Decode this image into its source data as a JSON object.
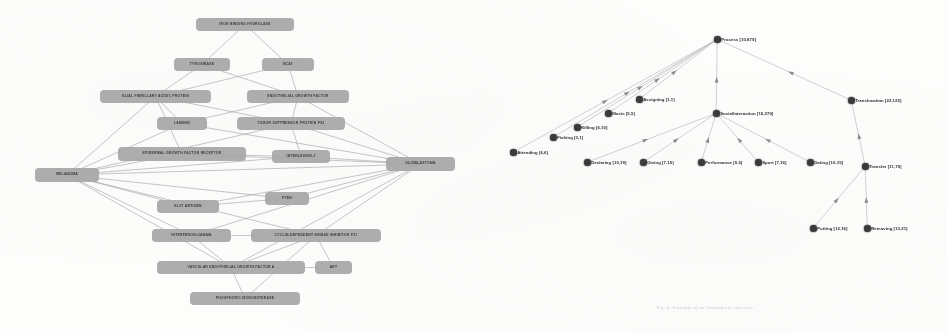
{
  "page": {
    "background_color": "#fdfdfc",
    "caption": "Fig. 4. Example of an Ontological structure"
  },
  "left_figure": {
    "name": "melanoma-glioblastoma-association-graph",
    "type": "node-link-graph",
    "node_fill_color": "#a8a8a8",
    "node_text_color": "#2e2e2e",
    "edge_color": "#9a9a9a",
    "hub_left": "MELANOMA",
    "hub_right": "GLIOBLASTOMA",
    "nodes": [
      {
        "id": "n0",
        "label": "IRON BINDING HYDROLASE",
        "x": 196,
        "y": 18,
        "w": 98,
        "h": 13
      },
      {
        "id": "n1",
        "label": "TYROSINASE",
        "x": 174,
        "y": 58,
        "w": 56,
        "h": 13
      },
      {
        "id": "n2",
        "label": "NCAT",
        "x": 262,
        "y": 58,
        "w": 52,
        "h": 13
      },
      {
        "id": "n3",
        "label": "GLIAL FIBRILLARY ACIDIC PROTEIN",
        "x": 100,
        "y": 90,
        "w": 111,
        "h": 13
      },
      {
        "id": "n4",
        "label": "ENDOTHELIAL GROWTH FACTOR",
        "x": 247,
        "y": 90,
        "w": 102,
        "h": 13
      },
      {
        "id": "n5",
        "label": "LAMININ",
        "x": 157,
        "y": 117,
        "w": 50,
        "h": 13
      },
      {
        "id": "n6",
        "label": "TUMOR SUPPRESSOR PROTEIN P53",
        "x": 237,
        "y": 117,
        "w": 108,
        "h": 13
      },
      {
        "id": "n7",
        "label": "EPIDERMAL GROWTH FACTOR RECEPTOR",
        "x": 118,
        "y": 147,
        "w": 128,
        "h": 14
      },
      {
        "id": "n8",
        "label": "INTERLEUKIN-2",
        "x": 272,
        "y": 150,
        "w": 58,
        "h": 13
      },
      {
        "id": "n9",
        "label": "MELANOMA",
        "x": 35,
        "y": 168,
        "w": 64,
        "h": 14
      },
      {
        "id": "n10",
        "label": "GLIOBLASTOMA",
        "x": 386,
        "y": 157,
        "w": 69,
        "h": 14
      },
      {
        "id": "n11",
        "label": "KI-67 ANTIGEN",
        "x": 157,
        "y": 200,
        "w": 62,
        "h": 13
      },
      {
        "id": "n12",
        "label": "PTEN",
        "x": 265,
        "y": 192,
        "w": 44,
        "h": 13
      },
      {
        "id": "n13",
        "label": "INTERFERON-GAMMA",
        "x": 152,
        "y": 229,
        "w": 79,
        "h": 13
      },
      {
        "id": "n14",
        "label": "CYCLIN-DEPENDENT KINASE INHIBITOR P21",
        "x": 251,
        "y": 229,
        "w": 130,
        "h": 13
      },
      {
        "id": "n15",
        "label": "VASCULAR ENDOTHELIAL GROWTH FACTOR A",
        "x": 157,
        "y": 261,
        "w": 148,
        "h": 13
      },
      {
        "id": "n16",
        "label": "AKT",
        "x": 315,
        "y": 261,
        "w": 37,
        "h": 13
      },
      {
        "id": "n17",
        "label": "PHOSPHORIC MONOESTERASE",
        "x": 190,
        "y": 292,
        "w": 110,
        "h": 13
      }
    ],
    "edges": [
      [
        "n0",
        "n1"
      ],
      [
        "n0",
        "n2"
      ],
      [
        "n1",
        "n3"
      ],
      [
        "n1",
        "n4"
      ],
      [
        "n2",
        "n3"
      ],
      [
        "n2",
        "n4"
      ],
      [
        "n3",
        "n5"
      ],
      [
        "n3",
        "n6"
      ],
      [
        "n4",
        "n5"
      ],
      [
        "n4",
        "n6"
      ],
      [
        "n3",
        "n9"
      ],
      [
        "n3",
        "n7"
      ],
      [
        "n4",
        "n10"
      ],
      [
        "n6",
        "n10"
      ],
      [
        "n6",
        "n8"
      ],
      [
        "n9",
        "n5"
      ],
      [
        "n9",
        "n6"
      ],
      [
        "n9",
        "n7"
      ],
      [
        "n9",
        "n8"
      ],
      [
        "n9",
        "n11"
      ],
      [
        "n9",
        "n12"
      ],
      [
        "n9",
        "n13"
      ],
      [
        "n9",
        "n14"
      ],
      [
        "n9",
        "n15"
      ],
      [
        "n9",
        "n10"
      ],
      [
        "n10",
        "n7"
      ],
      [
        "n10",
        "n8"
      ],
      [
        "n10",
        "n11"
      ],
      [
        "n10",
        "n12"
      ],
      [
        "n10",
        "n13"
      ],
      [
        "n10",
        "n14"
      ],
      [
        "n10",
        "n15"
      ],
      [
        "n10",
        "n5"
      ],
      [
        "n7",
        "n8"
      ],
      [
        "n11",
        "n12"
      ],
      [
        "n13",
        "n15"
      ],
      [
        "n13",
        "n14"
      ],
      [
        "n14",
        "n15"
      ],
      [
        "n14",
        "n16"
      ],
      [
        "n15",
        "n17"
      ],
      [
        "n15",
        "n16"
      ],
      [
        "n17",
        "n14"
      ]
    ]
  },
  "right_figure": {
    "name": "process-ontology-tree",
    "type": "directed-tree",
    "node_color": "#3a3a3a",
    "edge_color": "#bdbdbd",
    "label_color": "#2b2b2b",
    "nodes": [
      {
        "id": "p_process",
        "label": "Process [10,879]",
        "x": 244,
        "y": 36
      },
      {
        "id": "p_social",
        "label": "SocialInteraction [15,270]",
        "x": 243,
        "y": 110
      },
      {
        "id": "p_transloc",
        "label": "Translocation [22,122]",
        "x": 378,
        "y": 97
      },
      {
        "id": "p_transfer",
        "label": "Transfer [11,79]",
        "x": 392,
        "y": 163
      },
      {
        "id": "p_putting",
        "label": "Putting [12,16]",
        "x": 340,
        "y": 225
      },
      {
        "id": "p_removing",
        "label": "Removing [13,21]",
        "x": 394,
        "y": 225
      },
      {
        "id": "p_assigning",
        "label": "Assigning [1,1]",
        "x": 166,
        "y": 96
      },
      {
        "id": "p_music",
        "label": "Music [5,5]",
        "x": 135,
        "y": 110
      },
      {
        "id": "p_killing",
        "label": "Killing [6,10]",
        "x": 104,
        "y": 124
      },
      {
        "id": "p_fishing",
        "label": "Fishing [3,1]",
        "x": 80,
        "y": 134
      },
      {
        "id": "p_attending",
        "label": "Attending [6,6]",
        "x": 40,
        "y": 149
      },
      {
        "id": "p_declaring",
        "label": "Declaring [10,19]",
        "x": 114,
        "y": 159
      },
      {
        "id": "p_giving",
        "label": "Giving [7,15]",
        "x": 170,
        "y": 159
      },
      {
        "id": "p_performance",
        "label": "Performance [5,5]",
        "x": 228,
        "y": 159
      },
      {
        "id": "p_sport",
        "label": "Sport [7,16]",
        "x": 285,
        "y": 159
      },
      {
        "id": "p_dating",
        "label": "Dating [10,15]",
        "x": 337,
        "y": 159
      }
    ],
    "edges": [
      [
        "p_process",
        "p_attending"
      ],
      [
        "p_process",
        "p_fishing"
      ],
      [
        "p_process",
        "p_killing"
      ],
      [
        "p_process",
        "p_music"
      ],
      [
        "p_process",
        "p_assigning"
      ],
      [
        "p_process",
        "p_social"
      ],
      [
        "p_process",
        "p_transloc"
      ],
      [
        "p_social",
        "p_declaring"
      ],
      [
        "p_social",
        "p_giving"
      ],
      [
        "p_social",
        "p_performance"
      ],
      [
        "p_social",
        "p_sport"
      ],
      [
        "p_social",
        "p_dating"
      ],
      [
        "p_transloc",
        "p_transfer"
      ],
      [
        "p_transfer",
        "p_putting"
      ],
      [
        "p_transfer",
        "p_removing"
      ]
    ]
  }
}
